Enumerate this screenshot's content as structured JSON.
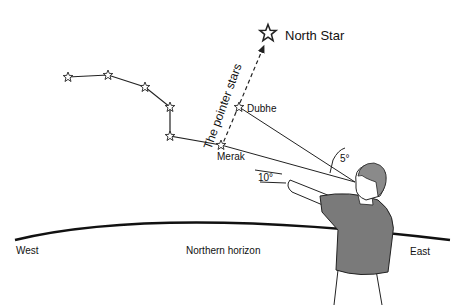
{
  "diagram": {
    "labels": {
      "north_star": "North Star",
      "pointer_stars": "The pointer stars",
      "dubhe": "Dubhe",
      "merak": "Merak",
      "angle_small": "5°",
      "angle_fist": "10°",
      "west": "West",
      "northern_horizon": "Northern horizon",
      "east": "East"
    },
    "stars": [
      {
        "name": "handle-end",
        "x": 68,
        "y": 77
      },
      {
        "name": "handle-2",
        "x": 108,
        "y": 75
      },
      {
        "name": "handle-3",
        "x": 145,
        "y": 87
      },
      {
        "name": "bowl-top-left",
        "x": 170,
        "y": 107
      },
      {
        "name": "bowl-bottom-left",
        "x": 170,
        "y": 136
      },
      {
        "name": "Merak",
        "x": 221,
        "y": 145
      },
      {
        "name": "Dubhe",
        "x": 239,
        "y": 107
      },
      {
        "name": "North Star",
        "x": 268,
        "y": 33
      }
    ],
    "colors": {
      "line": "#222222",
      "shirt": "#7a7a7a",
      "skin": "#ffffff",
      "hair": "#8a8a8a"
    }
  }
}
